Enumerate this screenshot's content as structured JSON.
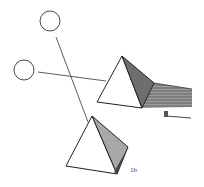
{
  "figure": {
    "panel_label": "1b",
    "arrow_label": "a",
    "colors": {
      "stroke": "#222222",
      "face_light": "#ffffff",
      "face_dark": "#6e6e6e",
      "face_mid": "#a8a8a8",
      "shadow": "#8a8a8a"
    },
    "light_sources": [
      {
        "name": "upper-light",
        "cx": 50,
        "cy": 21,
        "r": 10
      },
      {
        "name": "left-light",
        "cx": 24,
        "cy": 70,
        "r": 10
      }
    ],
    "pyramids": [
      {
        "name": "upper-pyramid",
        "has_cast_shadow": true
      },
      {
        "name": "lower-pyramid",
        "has_cast_shadow": false
      }
    ]
  }
}
